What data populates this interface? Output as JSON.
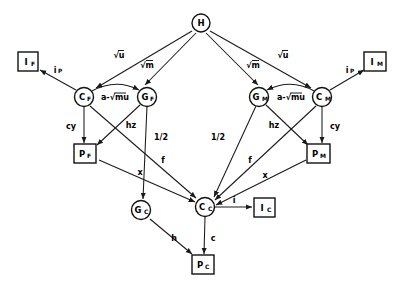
{
  "diagram": {
    "background_color": "#ffffff",
    "line_color": "#1a1a1a",
    "nodes": [
      {
        "id": "H",
        "label": "H",
        "sub": "",
        "shape": "circle",
        "x": 201,
        "y": 23
      },
      {
        "id": "IF",
        "label": "I",
        "sub": "F",
        "shape": "rect",
        "x": 28,
        "y": 62
      },
      {
        "id": "IM",
        "label": "I",
        "sub": "M",
        "shape": "rect",
        "x": 375,
        "y": 62
      },
      {
        "id": "CF",
        "label": "C",
        "sub": "F",
        "shape": "circle",
        "x": 84,
        "y": 97
      },
      {
        "id": "GF",
        "label": "G",
        "sub": "F",
        "shape": "circle",
        "x": 147,
        "y": 97
      },
      {
        "id": "GM",
        "label": "G",
        "sub": "M",
        "shape": "circle",
        "x": 259,
        "y": 97
      },
      {
        "id": "CM",
        "label": "C",
        "sub": "M",
        "shape": "circle",
        "x": 322,
        "y": 97
      },
      {
        "id": "PF",
        "label": "P",
        "sub": "F",
        "shape": "rect",
        "x": 85,
        "y": 153
      },
      {
        "id": "PM",
        "label": "P",
        "sub": "M",
        "shape": "rect",
        "x": 318,
        "y": 153
      },
      {
        "id": "GC",
        "label": "G",
        "sub": "C",
        "shape": "circle",
        "x": 141,
        "y": 210
      },
      {
        "id": "CC",
        "label": "C",
        "sub": "C",
        "shape": "circle",
        "x": 205,
        "y": 207
      },
      {
        "id": "IC",
        "label": "I",
        "sub": "C",
        "shape": "rect",
        "x": 264,
        "y": 207
      },
      {
        "id": "PC",
        "label": "P",
        "sub": "C",
        "shape": "rect",
        "x": 203,
        "y": 265
      }
    ],
    "edges": [
      {
        "from": "H",
        "to": "CF",
        "label": "√u",
        "radical": true,
        "label_x": 119,
        "label_y": 55
      },
      {
        "from": "H",
        "to": "GF",
        "label": "√m",
        "radical": true,
        "label_x": 147,
        "label_y": 65
      },
      {
        "from": "H",
        "to": "GM",
        "label": "√m",
        "radical": true,
        "label_x": 253,
        "label_y": 65
      },
      {
        "from": "H",
        "to": "CM",
        "label": "√u",
        "radical": true,
        "label_x": 283,
        "label_y": 55
      },
      {
        "from": "CF",
        "to": "GF",
        "label": "a-√mu",
        "radical": false,
        "label_x": 115,
        "label_y": 97
      },
      {
        "from": "CM",
        "to": "GM",
        "label": "a-√mu",
        "radical": false,
        "label_x": 291,
        "label_y": 97
      },
      {
        "from": "CF",
        "to": "IF",
        "label": "i",
        "sub": "P",
        "radical": false,
        "label_x": 57,
        "label_y": 70
      },
      {
        "from": "CM",
        "to": "IM",
        "label": "i",
        "sub": "P",
        "radical": false,
        "label_x": 349,
        "label_y": 70
      },
      {
        "from": "CF",
        "to": "PF",
        "label": "cy",
        "radical": false,
        "label_x": 71,
        "label_y": 126
      },
      {
        "from": "CM",
        "to": "PM",
        "label": "cy",
        "radical": false,
        "label_x": 333,
        "label_y": 126
      },
      {
        "from": "GF",
        "to": "PF",
        "label": "hz",
        "radical": false,
        "label_x": 131,
        "label_y": 125
      },
      {
        "from": "GM",
        "to": "PM",
        "label": "hz",
        "radical": false,
        "label_x": 273,
        "label_y": 125
      },
      {
        "from": "GF",
        "to": "GC",
        "label": "1/2",
        "radical": false,
        "label_x": 160,
        "label_y": 137
      },
      {
        "from": "GM",
        "to": "CC",
        "label": "1/2",
        "radical": false,
        "label_x": 219,
        "label_y": 137
      },
      {
        "from": "CF",
        "to": "CC",
        "label": "f",
        "radical": false,
        "label_x": 163,
        "label_y": 160
      },
      {
        "from": "CM",
        "to": "CC",
        "label": "f",
        "radical": false,
        "label_x": 251,
        "label_y": 160
      },
      {
        "from": "PF",
        "to": "CC",
        "label": "x",
        "radical": false,
        "label_x": 140,
        "label_y": 172
      },
      {
        "from": "PM",
        "to": "CC",
        "label": "x",
        "radical": false,
        "label_x": 264,
        "label_y": 175
      },
      {
        "from": "CC",
        "to": "IC",
        "label": "i",
        "radical": false,
        "label_x": 235,
        "label_y": 200
      },
      {
        "from": "GC",
        "to": "PC",
        "label": "h",
        "radical": false,
        "label_x": 174,
        "label_y": 238
      },
      {
        "from": "CC",
        "to": "PC",
        "label": "c",
        "radical": false,
        "label_x": 213,
        "label_y": 238
      }
    ]
  }
}
